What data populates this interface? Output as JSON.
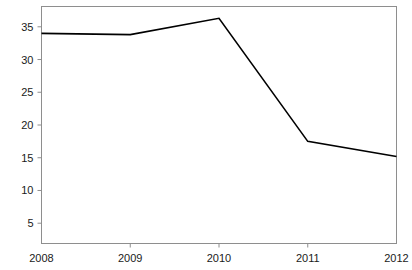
{
  "chart_data": {
    "type": "line",
    "title": "",
    "subtitle": "",
    "xlabel": "",
    "ylabel": "",
    "x": [
      2008,
      2009,
      2010,
      2011,
      2012
    ],
    "categories": [
      "2008",
      "2009",
      "2010",
      "2011",
      "2012"
    ],
    "series": [
      {
        "name": "",
        "values": [
          34,
          33.8,
          36.3,
          17.5,
          15.2
        ],
        "color": "#000000"
      }
    ],
    "xlim": [
      2008,
      2012
    ],
    "ylim": [
      1.9,
      38.1
    ],
    "yticks": [
      5,
      10,
      15,
      20,
      25,
      30,
      35
    ],
    "ytick_labels": [
      "5",
      "10",
      "15",
      "20",
      "25",
      "30",
      "35"
    ],
    "xticks": [
      2008,
      2009,
      2010,
      2011,
      2012
    ],
    "xtick_labels": [
      "2008",
      "2009",
      "2010",
      "2011",
      "2012"
    ],
    "grid": false,
    "legend": false,
    "legend_position": "none",
    "annotations": [],
    "frame_color": "#8e8e8e",
    "line_color": "#000000",
    "background_color": "#ffffff"
  }
}
